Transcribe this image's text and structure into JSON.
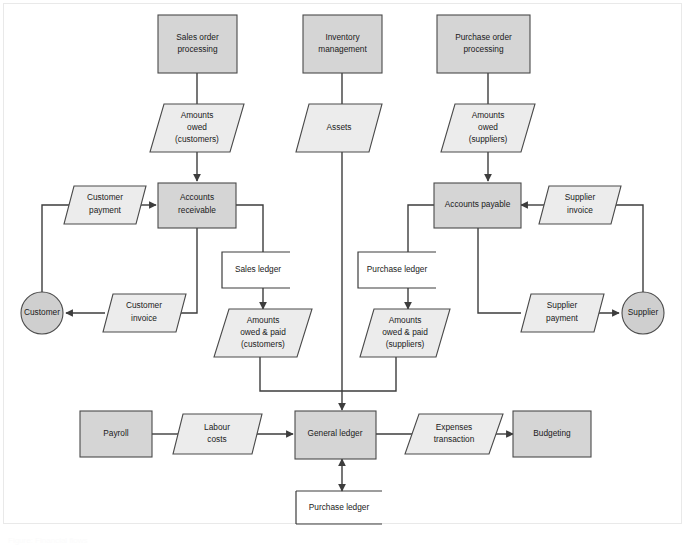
{
  "diagram": {
    "caption": "Figure: Financial flows",
    "colors": {
      "process_fill": "#d5d5d5",
      "flow_fill": "#ececec",
      "entity_fill": "#cfcfcf",
      "stroke": "#4a4a4a",
      "connector": "#3d3d3d",
      "background": "#ffffff"
    },
    "processes": [
      {
        "id": "sales_order_processing",
        "label_line1": "Sales order",
        "label_line2": "processing"
      },
      {
        "id": "inventory_management",
        "label_line1": "Inventory",
        "label_line2": "management"
      },
      {
        "id": "purchase_order_processing",
        "label_line1": "Purchase order",
        "label_line2": "processing"
      },
      {
        "id": "accounts_receivable",
        "label_line1": "Accounts",
        "label_line2": "receivable"
      },
      {
        "id": "accounts_payable",
        "label_line1": "Accounts payable",
        "label_line2": ""
      },
      {
        "id": "payroll",
        "label_line1": "Payroll",
        "label_line2": ""
      },
      {
        "id": "general_ledger",
        "label_line1": "General ledger",
        "label_line2": ""
      },
      {
        "id": "budgeting",
        "label_line1": "Budgeting",
        "label_line2": ""
      }
    ],
    "flows": [
      {
        "id": "amounts_owed_customers",
        "label_line1": "Amounts",
        "label_line2": "owed",
        "label_line3": "(customers)"
      },
      {
        "id": "assets",
        "label_line1": "Assets",
        "label_line2": "",
        "label_line3": ""
      },
      {
        "id": "amounts_owed_suppliers",
        "label_line1": "Amounts",
        "label_line2": "owed",
        "label_line3": "(suppliers)"
      },
      {
        "id": "customer_payment",
        "label_line1": "Customer",
        "label_line2": "payment",
        "label_line3": ""
      },
      {
        "id": "supplier_invoice",
        "label_line1": "Supplier",
        "label_line2": "invoice",
        "label_line3": ""
      },
      {
        "id": "customer_invoice",
        "label_line1": "Customer",
        "label_line2": "invoice",
        "label_line3": ""
      },
      {
        "id": "supplier_payment",
        "label_line1": "Supplier",
        "label_line2": "payment",
        "label_line3": ""
      },
      {
        "id": "amounts_owed_paid_customers",
        "label_line1": "Amounts",
        "label_line2": "owed & paid",
        "label_line3": "(customers)"
      },
      {
        "id": "amounts_owed_paid_suppliers",
        "label_line1": "Amounts",
        "label_line2": "owed & paid",
        "label_line3": "(suppliers)"
      },
      {
        "id": "labour_costs",
        "label_line1": "Labour",
        "label_line2": "costs",
        "label_line3": ""
      },
      {
        "id": "expenses_transaction",
        "label_line1": "Expenses",
        "label_line2": "transaction",
        "label_line3": ""
      }
    ],
    "entities": [
      {
        "id": "customer",
        "label": "Customer"
      },
      {
        "id": "supplier",
        "label": "Supplier"
      }
    ],
    "stores": [
      {
        "id": "sales_ledger",
        "label": "Sales ledger"
      },
      {
        "id": "purchase_ledger_top",
        "label": "Purchase ledger"
      },
      {
        "id": "purchase_ledger_bottom",
        "label": "Purchase ledger"
      }
    ]
  }
}
